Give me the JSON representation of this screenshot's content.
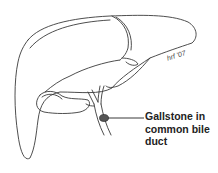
{
  "diagram": {
    "annotation": {
      "label": "Gallstone in\ncommon bile\nduct",
      "label_lines": [
        "Gallstone in",
        "common bile",
        "duct"
      ]
    },
    "signature": "hrf '07",
    "colors": {
      "outline": "#3a3a3a",
      "gallstone": "#555555",
      "background": "#ffffff",
      "text": "#222222"
    }
  }
}
